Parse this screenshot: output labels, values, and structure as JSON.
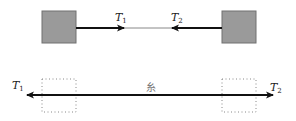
{
  "diagram": {
    "colors": {
      "block_fill": "#9a9a9a",
      "block_stroke": "#707070",
      "arrow": "#111111",
      "thin_line": "#888888",
      "dotted_box": "#888888",
      "string_label": "#777777"
    },
    "top": {
      "left_block": {
        "x": 42,
        "y": 11,
        "w": 34,
        "h": 32
      },
      "right_block": {
        "x": 222,
        "y": 11,
        "w": 34,
        "h": 32
      },
      "line_y": 28,
      "left_arrow": {
        "from": 76,
        "to": 124,
        "direction": "right"
      },
      "right_arrow": {
        "from": 222,
        "to": 172,
        "direction": "left"
      },
      "thin_segment": {
        "from": 124,
        "to": 172
      },
      "labels": [
        {
          "id": "T1",
          "base": "T",
          "sub": "1",
          "x": 115,
          "y": 21
        },
        {
          "id": "T2",
          "base": "T",
          "sub": "2",
          "x": 171,
          "y": 21
        }
      ]
    },
    "bottom": {
      "line_y": 95,
      "left_dotted_box": {
        "x": 42,
        "y": 79,
        "w": 34,
        "h": 33
      },
      "right_dotted_box": {
        "x": 222,
        "y": 79,
        "w": 34,
        "h": 33
      },
      "string": {
        "from": 27,
        "to": 273
      },
      "string_label": "糸",
      "string_label_pos": {
        "x": 151,
        "y": 91
      },
      "labels": [
        {
          "id": "T1",
          "base": "T",
          "sub": "1",
          "x": 12,
          "y": 89
        },
        {
          "id": "T2",
          "base": "T",
          "sub": "2",
          "x": 270,
          "y": 91
        }
      ]
    }
  }
}
